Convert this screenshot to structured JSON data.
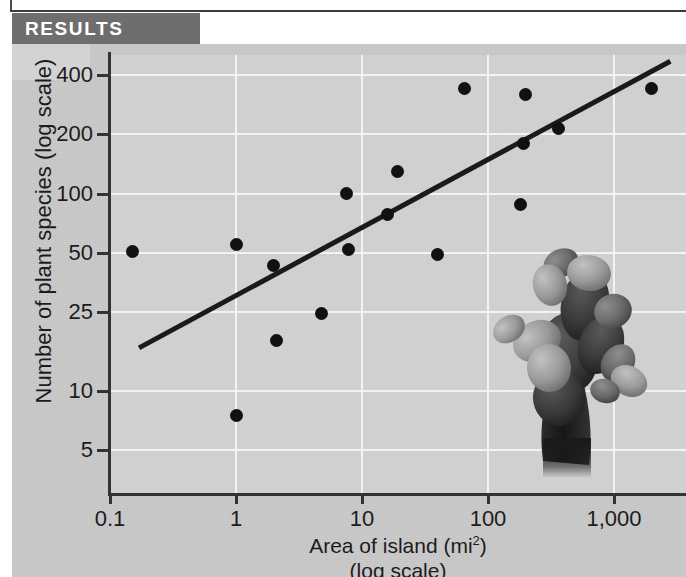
{
  "banner": {
    "label": "RESULTS"
  },
  "chart_data": {
    "type": "scatter",
    "title": "",
    "xlabel": "Area of island (mi2)",
    "xlabel_line2": "(log scale)",
    "ylabel": "Number of plant species (log scale)",
    "x_scale": "log",
    "y_scale": "log",
    "xlim": [
      0.1,
      2800
    ],
    "ylim": [
      4.2,
      520
    ],
    "grid": true,
    "legend": null,
    "xticks": [
      0.1,
      1,
      10,
      100,
      1000
    ],
    "xtick_labels": [
      "0.1",
      "1",
      "10",
      "100",
      "1,000"
    ],
    "yticks": [
      5,
      10,
      25,
      50,
      100,
      200,
      400
    ],
    "ytick_labels": [
      "5",
      "10",
      "25",
      "50",
      "100",
      "200",
      "400"
    ],
    "points": [
      {
        "x": 0.15,
        "y": 51
      },
      {
        "x": 1.0,
        "y": 7.5
      },
      {
        "x": 1.0,
        "y": 55
      },
      {
        "x": 2.0,
        "y": 43
      },
      {
        "x": 2.1,
        "y": 18
      },
      {
        "x": 4.8,
        "y": 24.5
      },
      {
        "x": 7.5,
        "y": 100
      },
      {
        "x": 7.8,
        "y": 52
      },
      {
        "x": 16,
        "y": 78
      },
      {
        "x": 19,
        "y": 130
      },
      {
        "x": 40,
        "y": 49
      },
      {
        "x": 65,
        "y": 340
      },
      {
        "x": 180,
        "y": 88
      },
      {
        "x": 190,
        "y": 180
      },
      {
        "x": 200,
        "y": 320
      },
      {
        "x": 360,
        "y": 215
      },
      {
        "x": 2000,
        "y": 340
      }
    ],
    "trendline": {
      "type": "linear-in-log-log",
      "x_start": 0.17,
      "y_start": 16.5,
      "x_end": 2800,
      "y_end": 470
    },
    "annotation_image": "prickly-pear-cactus"
  },
  "colors": {
    "banner_bg": "#6e6e6e",
    "banner_text": "#ffffff",
    "panel_bg": "#c9c9c9",
    "plot_bg": "#d2d2d2",
    "gridline": "#f3f3f3",
    "axis": "#333333",
    "point": "#111111",
    "trendline": "#1a1a1a",
    "text": "#1c1c1c"
  }
}
